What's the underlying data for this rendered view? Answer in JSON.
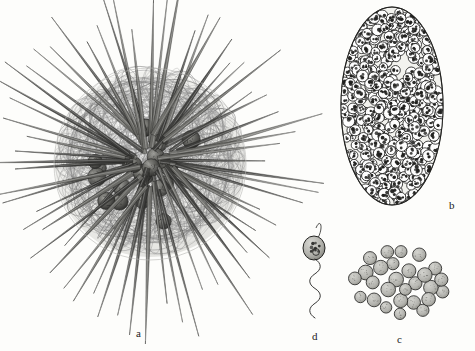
{
  "figure": {
    "kind": "scientific-illustration",
    "background_color": "#fdfdfb",
    "ink_color": "#1b1b1b",
    "width": 475,
    "height": 351
  },
  "panels": [
    {
      "id": "a",
      "label": "a",
      "name": "spiny-radiolarian-whole-cell",
      "description": "whole spherical radiolarian with radiating tapered spicules, fibrous skeletal meshwork and dark internal capsules",
      "center_x": 150,
      "center_y": 160,
      "body_radius": 96,
      "spicule_count": 64,
      "spicule_max_length": 150,
      "mesh_fiber_count": 150,
      "capsule_count": 22,
      "label_x": 136,
      "label_y": 328
    },
    {
      "id": "b",
      "label": "b",
      "name": "oval-sporocyst-mass",
      "description": "oval body densely packed with several hundred small ring-like daughter cells",
      "center_x": 392,
      "center_y": 106,
      "radius_x": 51,
      "radius_y": 99,
      "cell_count": 430,
      "cell_radius": 5.2,
      "label_x": 449,
      "label_y": 200
    },
    {
      "id": "c",
      "label": "c",
      "name": "released-spore-cluster",
      "description": "loose cluster of about thirty rounded spores with granular contents",
      "center_x": 400,
      "center_y": 283,
      "spread_x": 46,
      "spread_y": 33,
      "cell_count": 31,
      "cell_radius": 6.6,
      "label_x": 397,
      "label_y": 334
    },
    {
      "id": "d",
      "label": "d",
      "name": "flagellated-swarmer",
      "description": "single biflagellate swarmer cell with granular inclusions and a long undulating flagellum",
      "cell_x": 314,
      "cell_y": 248,
      "cell_radius_x": 11,
      "cell_radius_y": 12,
      "flagellum_top_y": 228,
      "flagellum_bottom_y": 318,
      "flagellum_waves": 4,
      "granule_count": 9,
      "label_x": 312,
      "label_y": 331
    }
  ],
  "palette": {
    "ink": "#1b1b1b",
    "mid_gray": "#6d6d6d",
    "light_gray": "#a8a8a8",
    "mesh_gray": "#9a9a9a",
    "cell_fill": "#b9b9b4",
    "capsule_dark": "#3a3a3a",
    "paper": "#fdfdfb"
  }
}
